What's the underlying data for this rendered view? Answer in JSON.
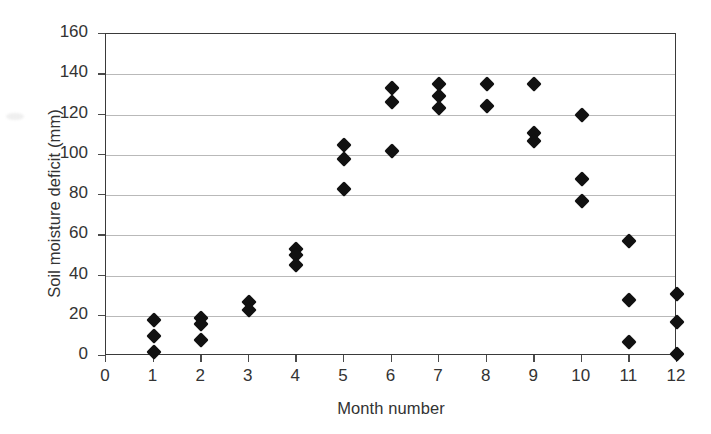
{
  "chart_data": {
    "type": "scatter",
    "title": "",
    "xlabel": "Month number",
    "ylabel": "Soil moisture deficit (mm)",
    "xlim": [
      0,
      12
    ],
    "ylim": [
      0,
      160
    ],
    "xticks": [
      0,
      1,
      2,
      3,
      4,
      5,
      6,
      7,
      8,
      9,
      10,
      11,
      12
    ],
    "yticks": [
      0,
      20,
      40,
      60,
      80,
      100,
      120,
      140,
      160
    ],
    "grid": "horizontal",
    "legend": "none",
    "marker": "diamond",
    "marker_color": "#111111",
    "points": [
      {
        "x": 1,
        "y": 18
      },
      {
        "x": 1,
        "y": 10
      },
      {
        "x": 1,
        "y": 2
      },
      {
        "x": 2,
        "y": 19
      },
      {
        "x": 2,
        "y": 16
      },
      {
        "x": 2,
        "y": 8
      },
      {
        "x": 3,
        "y": 27
      },
      {
        "x": 3,
        "y": 23
      },
      {
        "x": 4,
        "y": 53
      },
      {
        "x": 4,
        "y": 50
      },
      {
        "x": 4,
        "y": 45
      },
      {
        "x": 5,
        "y": 105
      },
      {
        "x": 5,
        "y": 98
      },
      {
        "x": 5,
        "y": 83
      },
      {
        "x": 6,
        "y": 133
      },
      {
        "x": 6,
        "y": 126
      },
      {
        "x": 6,
        "y": 102
      },
      {
        "x": 7,
        "y": 135
      },
      {
        "x": 7,
        "y": 129
      },
      {
        "x": 7,
        "y": 123
      },
      {
        "x": 8,
        "y": 135
      },
      {
        "x": 8,
        "y": 124
      },
      {
        "x": 9,
        "y": 135
      },
      {
        "x": 9,
        "y": 111
      },
      {
        "x": 9,
        "y": 107
      },
      {
        "x": 10,
        "y": 120
      },
      {
        "x": 10,
        "y": 88
      },
      {
        "x": 10,
        "y": 77
      },
      {
        "x": 11,
        "y": 57
      },
      {
        "x": 11,
        "y": 28
      },
      {
        "x": 11,
        "y": 7
      },
      {
        "x": 12,
        "y": 31
      },
      {
        "x": 12,
        "y": 17
      },
      {
        "x": 12,
        "y": 1
      }
    ]
  }
}
